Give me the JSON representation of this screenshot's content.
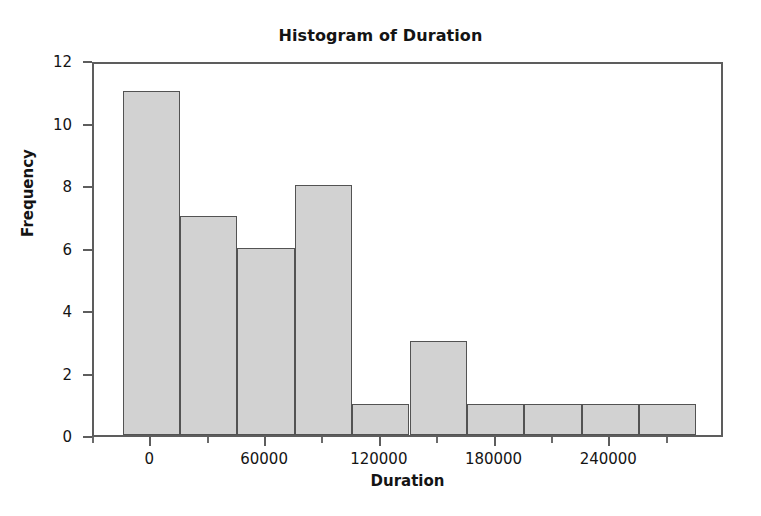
{
  "chart_data": {
    "type": "bar",
    "title": "Histogram of Duration",
    "xlabel": "Duration",
    "ylabel": "Frequency",
    "categories": [
      "-15000 to 15000",
      "15000 to 45000",
      "45000 to 75000",
      "75000 to 105000",
      "105000 to 135000",
      "135000 to 165000",
      "165000 to 195000",
      "195000 to 225000",
      "225000 to 255000",
      "255000 to 285000"
    ],
    "bin_edges": [
      -15000,
      15000,
      45000,
      75000,
      105000,
      135000,
      165000,
      195000,
      225000,
      255000,
      285000
    ],
    "bin_width": 30000,
    "values": [
      11,
      7,
      6,
      8,
      1,
      3,
      1,
      1,
      1,
      1
    ],
    "total_count": 40,
    "xlim": [
      -30000,
      300000
    ],
    "ylim": [
      0,
      12
    ],
    "x_ticks": [
      0,
      60000,
      120000,
      180000,
      240000
    ],
    "x_tick_labels": [
      "0",
      "60000",
      "120000",
      "180000",
      "240000"
    ],
    "x_minor_ticks": [
      -30000,
      30000,
      90000,
      150000,
      210000,
      270000
    ],
    "y_ticks": [
      0,
      2,
      4,
      6,
      8,
      10,
      12
    ],
    "y_tick_labels": [
      "0",
      "2",
      "4",
      "6",
      "8",
      "10",
      "12"
    ],
    "grid": false,
    "legend": false,
    "bar_fill_color": "#d2d2d2",
    "bar_edge_color": "#535353",
    "frame_color": "#5d5d5d",
    "background_color": "#ffffff",
    "text_color": "#141414"
  }
}
